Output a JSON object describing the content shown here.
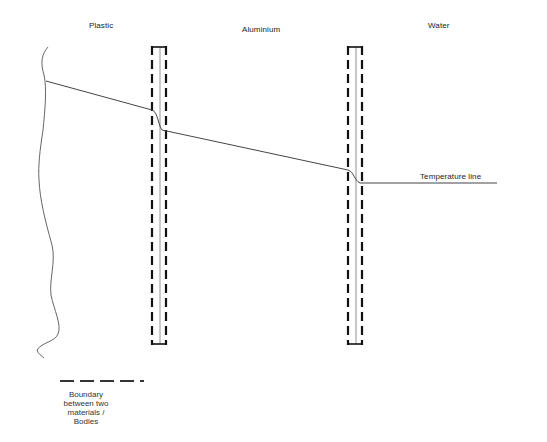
{
  "diagram": {
    "regions": [
      {
        "label": "Plastic"
      },
      {
        "label": "Aluminium"
      },
      {
        "label": "Water"
      }
    ],
    "temperature_line_label": "Temperature line",
    "legend": {
      "symbol": "dashed-line",
      "text_lines": [
        "Boundary",
        "between two",
        "materials /",
        "Bodies"
      ]
    },
    "colors": {
      "line": "#555555",
      "boundary": "#111111",
      "text": "#222222"
    }
  }
}
